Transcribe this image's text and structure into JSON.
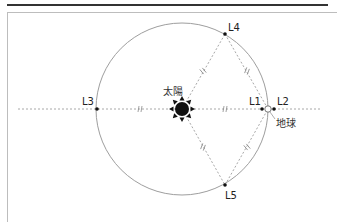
{
  "figure": {
    "labels": {
      "sun": "太陽",
      "earth": "地球",
      "L1": "L1",
      "L2": "L2",
      "L3": "L3",
      "L4": "L4",
      "L5": "L5"
    },
    "equal_marks": "//",
    "colors": {
      "rule": "#333333",
      "frame": "#bdbdbd",
      "orbit": "#9e9e9e",
      "dashed": "#a8a8a8",
      "point": "#111111",
      "sun": "#111111"
    }
  }
}
